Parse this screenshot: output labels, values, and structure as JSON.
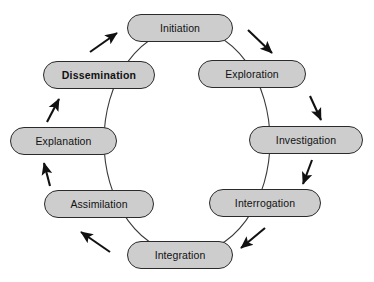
{
  "diagram": {
    "type": "cyclic-process",
    "title": "",
    "direction": "clockwise",
    "style": {
      "node_fill": "#cdcdcd",
      "node_stroke": "#2b2b2b",
      "arrow_color": "#111111",
      "ring_color": "#333333",
      "background": "#ffffff"
    },
    "nodes": [
      {
        "id": "initiation",
        "label": "Initiation",
        "bold": false
      },
      {
        "id": "exploration",
        "label": "Exploration",
        "bold": false
      },
      {
        "id": "investigation",
        "label": "Investigation",
        "bold": false
      },
      {
        "id": "interrogation",
        "label": "Interrogation",
        "bold": false
      },
      {
        "id": "integration",
        "label": "Integration",
        "bold": false
      },
      {
        "id": "assimilation",
        "label": "Assimilation",
        "bold": false
      },
      {
        "id": "explanation",
        "label": "Explanation",
        "bold": false
      },
      {
        "id": "dissemination",
        "label": "Dissemination",
        "bold": true
      }
    ],
    "edges": [
      {
        "from": "initiation",
        "to": "exploration"
      },
      {
        "from": "exploration",
        "to": "investigation"
      },
      {
        "from": "investigation",
        "to": "interrogation"
      },
      {
        "from": "interrogation",
        "to": "integration"
      },
      {
        "from": "integration",
        "to": "assimilation"
      },
      {
        "from": "assimilation",
        "to": "explanation"
      },
      {
        "from": "explanation",
        "to": "dissemination"
      },
      {
        "from": "dissemination",
        "to": "initiation"
      }
    ]
  }
}
